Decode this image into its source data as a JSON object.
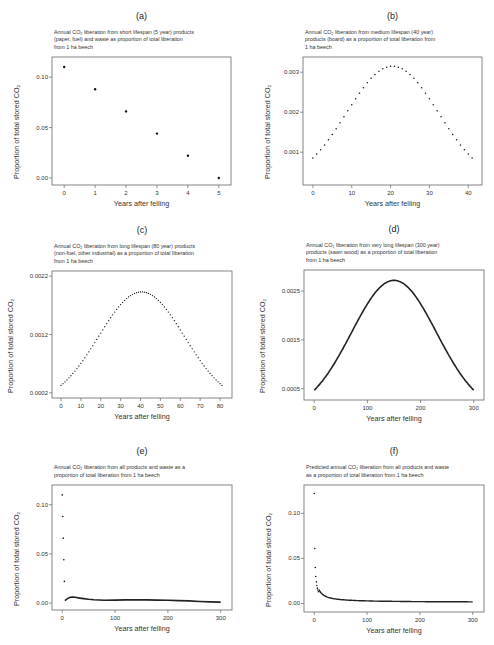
{
  "chart_data": [
    {
      "id": "a",
      "panel_label": "(a)",
      "type": "scatter",
      "title": [
        "Annual CO₂ liberation from short lifespan (5 year) products",
        "(paper, fuel) and waste as proportion of total liberation",
        "from 1 ha beech"
      ],
      "xlabel": "Years after felling",
      "ylabel": "Proportion of total stored CO₂",
      "xlim": [
        -0.2,
        5.2
      ],
      "ylim": [
        -0.003,
        0.116
      ],
      "xticks": [
        0,
        1,
        2,
        3,
        4,
        5
      ],
      "yticks": [
        0.0,
        0.05,
        0.1
      ],
      "ytick_labels": [
        "0.00",
        "0.05",
        "0.10"
      ],
      "x": [
        0,
        1,
        2,
        3,
        4,
        5
      ],
      "y": [
        0.11,
        0.088,
        0.066,
        0.044,
        0.022,
        0.0
      ],
      "box": [
        52,
        57,
        231,
        185
      ]
    },
    {
      "id": "b",
      "panel_label": "(b)",
      "type": "scatter",
      "title": [
        "Annual CO₂ liberation from medium lifespan (40 year)",
        "products (board) as a proportion of total liberation from",
        "1 ha beech"
      ],
      "xlabel": "Years after felling",
      "ylabel": "Proportion of total stored CO₂",
      "xlim": [
        -1,
        42
      ],
      "ylim": [
        0.00028,
        0.00328
      ],
      "xticks": [
        0,
        10,
        20,
        30,
        40
      ],
      "yticks": [
        0.001,
        0.002,
        0.003
      ],
      "ytick_labels": [
        "0.001",
        "0.002",
        "0.003"
      ],
      "curve": {
        "kind": "gauss",
        "n_from": 0,
        "n_to": 41,
        "step": 1,
        "peak_x": 20.5,
        "peak_y": 0.00315,
        "sigma": 11.8,
        "base": 0.0002
      },
      "box": [
        303,
        57,
        482,
        185
      ]
    },
    {
      "id": "c",
      "panel_label": "(c)",
      "type": "scatter",
      "title": [
        "Annual CO₂ liberation from long lifespan (80 year) products",
        "(non-fuel, other industrial) as a proportion of total liberation",
        "from 1 ha beech"
      ],
      "xlabel": "Years after felling",
      "ylabel": "Proportion of total stored CO₂",
      "xlim": [
        -1.5,
        83
      ],
      "ylim": [
        0.00018,
        0.00222
      ],
      "xticks": [
        0,
        10,
        20,
        30,
        40,
        50,
        60,
        70,
        80
      ],
      "yticks": [
        0.0002,
        0.0012,
        0.0022
      ],
      "ytick_labels": [
        "0.0002",
        "0.0012",
        "0.0022"
      ],
      "curve": {
        "kind": "gauss",
        "n_from": 0,
        "n_to": 81,
        "step": 1,
        "peak_x": 40.5,
        "peak_y": 0.00193,
        "sigma": 21.5,
        "base": 0.0
      },
      "box": [
        52,
        271,
        232,
        398
      ]
    },
    {
      "id": "d",
      "panel_label": "(d)",
      "type": "line",
      "title": [
        "Annual CO₂ liberation from very long lifespan (300 year)",
        "products (sawn wood) as a proportion of total liberation",
        "from 1 ha beech"
      ],
      "xlabel": "Years after felling",
      "ylabel": "Proportion of total stored CO₂",
      "xlim": [
        -8,
        308
      ],
      "ylim": [
        0.00035,
        0.00285
      ],
      "xticks": [
        0,
        100,
        200,
        300
      ],
      "yticks": [
        0.0005,
        0.0015,
        0.0025
      ],
      "ytick_labels": [
        "0.0005",
        "0.0015",
        "0.0025"
      ],
      "curve": {
        "kind": "gauss",
        "n_from": 0,
        "n_to": 300,
        "step": 2,
        "peak_x": 150,
        "peak_y": 0.00272,
        "sigma": 80,
        "base": 0.0
      },
      "box": [
        304,
        270,
        484,
        400
      ]
    },
    {
      "id": "e",
      "panel_label": "(e)",
      "type": "scatter+line",
      "title": [
        "Annual CO₂ liberation from all products and waste as a",
        "proportion of total liberation from 1 ha beech"
      ],
      "xlabel": "Years after felling",
      "ylabel": "Proportion of total stored CO₂",
      "xlim": [
        -8,
        310
      ],
      "ylim": [
        -0.003,
        0.116
      ],
      "xticks": [
        0,
        100,
        200,
        300
      ],
      "yticks": [
        0.0,
        0.05,
        0.1
      ],
      "ytick_labels": [
        "0.00",
        "0.05",
        "0.10"
      ],
      "points": {
        "x": [
          0,
          1,
          2,
          3,
          4
        ],
        "y": [
          0.11,
          0.088,
          0.066,
          0.044,
          0.022
        ]
      },
      "line": {
        "x": [
          5,
          10,
          15,
          20,
          25,
          30,
          40,
          50,
          60,
          80,
          100,
          120,
          140,
          160,
          180,
          200,
          220,
          240,
          260,
          280,
          300
        ],
        "y": [
          0.0025,
          0.0045,
          0.0058,
          0.0062,
          0.0058,
          0.0052,
          0.0045,
          0.0038,
          0.0033,
          0.0028,
          0.003,
          0.0032,
          0.0032,
          0.0032,
          0.003,
          0.0028,
          0.0025,
          0.0022,
          0.0016,
          0.0012,
          0.001
        ]
      },
      "box": [
        52,
        485,
        232,
        610
      ]
    },
    {
      "id": "f",
      "panel_label": "(f)",
      "type": "scatter",
      "title": [
        "Predicted annual CO₂ liberation from all products and waste",
        "as a proportion of total liberation from 1 ha beech"
      ],
      "xlabel": "Years after felling",
      "ylabel": "Proportion of total stored CO₂",
      "xlim": [
        -8,
        310
      ],
      "ylim": [
        -0.005,
        0.127
      ],
      "xticks": [
        0,
        100,
        200,
        300
      ],
      "yticks": [
        0.0,
        0.05,
        0.1
      ],
      "ytick_labels": [
        "0.00",
        "0.05",
        "0.10"
      ],
      "points": {
        "x": [
          0,
          1,
          2,
          3,
          4,
          5,
          6,
          7,
          8
        ],
        "y": [
          0.122,
          0.061,
          0.04,
          0.03,
          0.024,
          0.02,
          0.017,
          0.015,
          0.013
        ]
      },
      "curve": {
        "kind": "power",
        "n_from": 9,
        "n_to": 300,
        "step": 1,
        "a": 0.122,
        "b": -0.93,
        "base": 0.0012
      },
      "box": [
        304,
        485,
        484,
        612
      ]
    }
  ]
}
